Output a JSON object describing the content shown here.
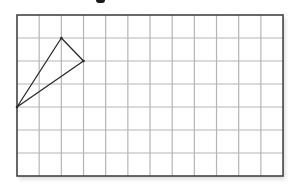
{
  "diagram": {
    "type": "grid-with-triangle",
    "grid": {
      "columns": 12,
      "rows": 7,
      "origin_px": [
        17,
        15
      ],
      "cell_width_px": 22.17,
      "cell_height_px": 23,
      "line_color": "#b5b5b5",
      "border_color": "#444444"
    },
    "triangle": {
      "vertices_grid": [
        [
          0,
          4
        ],
        [
          2,
          1
        ],
        [
          3,
          2
        ]
      ],
      "stroke_color": "#2a2a2a",
      "fill": "none"
    },
    "clipped_title_fragment": true
  }
}
